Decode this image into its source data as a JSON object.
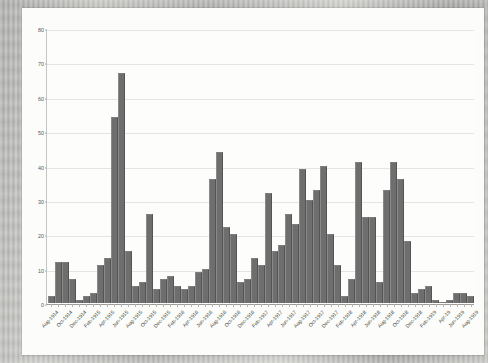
{
  "chart_data": {
    "type": "bar",
    "title": "",
    "subtitle": "",
    "xlabel": "",
    "ylabel": "Casualties",
    "ylim": [
      0,
      80
    ],
    "ytick_values": [
      0,
      10,
      20,
      30,
      40,
      50,
      60,
      70,
      80
    ],
    "ytick_labels": [
      "0",
      "10",
      "20",
      "30",
      "40",
      "50",
      "60",
      "70",
      "80"
    ],
    "grid": true,
    "legend": "none",
    "bar_color": "#6e6e6e",
    "categories": [
      "Aug-1914",
      "Sep-1914",
      "Oct-1914",
      "Nov-1914",
      "Dec-1914",
      "Jan-1915",
      "Feb-1915",
      "Mar-1915",
      "Apr-1915",
      "May-1915",
      "Jun-1915",
      "Jul-1915",
      "Aug-1915",
      "Sep-1915",
      "Oct-1915",
      "Nov-1915",
      "Dec-1915",
      "Jan-1916",
      "Feb-1916",
      "Mar-1916",
      "Apr-1916",
      "May-1916",
      "Jun-1916",
      "Jul-1916",
      "Aug-1916",
      "Sep-1916",
      "Oct-1916",
      "Nov-1916",
      "Dec-1916",
      "Jan-1917",
      "Feb-1917",
      "Mar-1917",
      "Apr-1917",
      "May-1917",
      "Jun-1917",
      "Jul-1917",
      "Aug-1917",
      "Sep-1917",
      "Oct-1917",
      "Nov-1917",
      "Dec-1917",
      "Jan-1918",
      "Feb-1918",
      "Mar-1918",
      "Apr-1918",
      "May-1918",
      "Jun-1918",
      "Jul-1918",
      "Aug-1918",
      "Sep-1918",
      "Oct-1918",
      "Nov-1918",
      "Dec-1918",
      "Jan-1919",
      "Feb-1919",
      "Mar-1919",
      "Apr-1919",
      "May-1919",
      "Jun-1919",
      "Jul-1919",
      "Aug-1919"
    ],
    "values": [
      2,
      12,
      12,
      7,
      1,
      2,
      3,
      11,
      13,
      54,
      67,
      15,
      5,
      6,
      26,
      4,
      7,
      8,
      5,
      4,
      5,
      9,
      10,
      36,
      44,
      22,
      20,
      6,
      7,
      13,
      11,
      32,
      15,
      17,
      26,
      23,
      39,
      30,
      33,
      40,
      20,
      11,
      2,
      7,
      41,
      25,
      25,
      6,
      33,
      41,
      36,
      18,
      3,
      4,
      5,
      1,
      0,
      1,
      3,
      3,
      2
    ],
    "xtick_label_indices": [
      0,
      2,
      4,
      6,
      8,
      10,
      12,
      14,
      16,
      18,
      20,
      22,
      24,
      26,
      28,
      30,
      32,
      34,
      36,
      38,
      40,
      42,
      44,
      46,
      48,
      50,
      52,
      54,
      56,
      58,
      60
    ],
    "xtick_labels": [
      "Aug-1914",
      "Oct-1914",
      "Dec-1914",
      "Feb-1915",
      "Apr-1915",
      "Jun-1915",
      "Aug-1915",
      "Oct-1915",
      "Dec-1915",
      "Feb-1916",
      "Apr-1916",
      "Jun-1916",
      "Aug-1916",
      "Oct-1916",
      "Dec-1916",
      "Feb-1917",
      "Apr-1917",
      "Jun-1917",
      "Aug-1917",
      "Oct-1917",
      "Dec-1917",
      "Feb-1918",
      "Apr-1918",
      "Jun-1918",
      "Aug-1918",
      "Oct-1918",
      "Dec-1918",
      "Feb-1919",
      "Apr-19",
      "Jun-1919",
      "Aug-1919"
    ]
  }
}
